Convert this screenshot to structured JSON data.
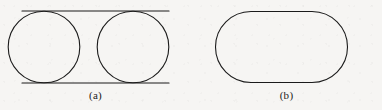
{
  "page": {
    "background_color": "#f6f5f3",
    "ink_color": "#1b1b1b",
    "width": 382,
    "height": 110
  },
  "figure": {
    "title": "",
    "panels": [
      {
        "id": "a",
        "caption": "(a)",
        "shape_name": "two-circles-between-parallel-tangents",
        "stroke_color": "#1b1b1b",
        "stroke_width": 1.1,
        "fill_color": "none",
        "top_line": {
          "x1": 22,
          "y1": 11,
          "x2": 169,
          "y2": 11
        },
        "bottom_line": {
          "x1": 22,
          "y1": 83,
          "x2": 169,
          "y2": 83
        },
        "circles": [
          {
            "name": "left-circle",
            "cx": 44,
            "cy": 47,
            "r": 36
          },
          {
            "name": "right-circle",
            "cx": 133,
            "cy": 47,
            "r": 36
          }
        ]
      },
      {
        "id": "b",
        "caption": "(b)",
        "shape_name": "stadium-capsule",
        "stroke_color": "#1b1b1b",
        "stroke_width": 1.1,
        "fill_color": "none",
        "bounds": {
          "x": 215,
          "y": 11,
          "width": 133,
          "height": 72
        },
        "corner_radius": 36,
        "top_line": {
          "x1": 251,
          "y1": 11,
          "x2": 312,
          "y2": 11
        },
        "bottom_line": {
          "x1": 251,
          "y1": 83,
          "x2": 312,
          "y2": 83
        }
      }
    ]
  }
}
